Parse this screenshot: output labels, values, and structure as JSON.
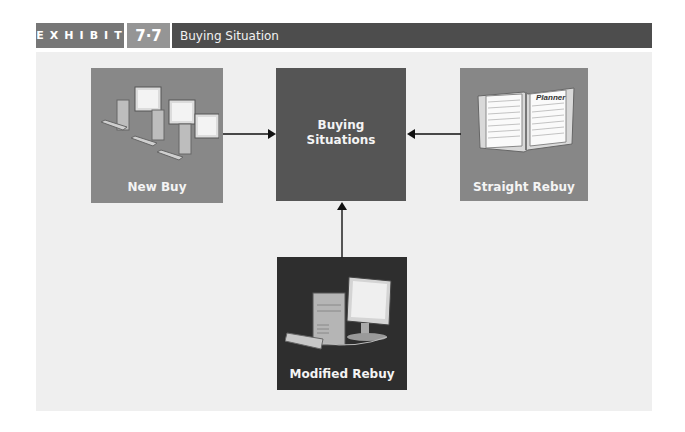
{
  "header": {
    "exhibit_label": "EXHIBIT",
    "exhibit_number": "7·7",
    "title": "Buying Situation"
  },
  "diagram": {
    "center": {
      "label_line1": "Buying",
      "label_line2": "Situations",
      "color": "#555555"
    },
    "nodes": [
      {
        "id": "new-buy",
        "label": "New Buy",
        "icon": "computer-network-icon",
        "color": "#888888"
      },
      {
        "id": "straight-rebuy",
        "label": "Straight Rebuy",
        "icon": "planner-notebook-icon",
        "planner_text": "Planner",
        "color": "#878787"
      },
      {
        "id": "modified-rebuy",
        "label": "Modified Rebuy",
        "icon": "desktop-computer-icon",
        "color": "#2e2e2e"
      }
    ],
    "edges": [
      {
        "from": "new-buy",
        "to": "center"
      },
      {
        "from": "straight-rebuy",
        "to": "center"
      },
      {
        "from": "modified-rebuy",
        "to": "center"
      }
    ]
  },
  "colors": {
    "header_exhibit": "#777777",
    "header_number": "#959595",
    "header_title": "#4d4d4d",
    "panel_bg": "#efefef"
  }
}
